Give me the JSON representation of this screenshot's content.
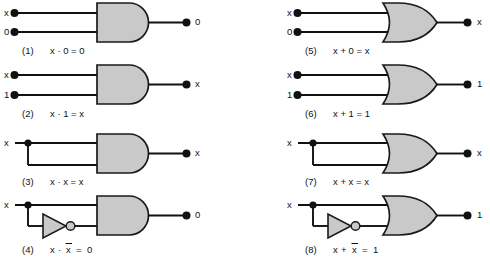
{
  "figure": {
    "background_color": "#ffffff",
    "gate_fill_color": "#c9c9c9",
    "line_color": "#111111"
  },
  "columns": [
    {
      "name": "and-column",
      "gate_type": "AND"
    },
    {
      "name": "or-column",
      "gate_type": "OR"
    }
  ],
  "circuits": [
    {
      "number": "(1)",
      "gate": "and-gate",
      "inputs": [
        "x",
        "0"
      ],
      "output": "0",
      "caption_expr": "x · 0 = 0",
      "expr_parts": [
        "x",
        "·",
        "0",
        "=",
        "0"
      ],
      "has_inverter": false,
      "has_junction": false,
      "column": "left"
    },
    {
      "number": "(2)",
      "gate": "and-gate",
      "inputs": [
        "x",
        "1"
      ],
      "output": "x",
      "caption_expr": "x · 1 = x",
      "expr_parts": [
        "x",
        "·",
        "1",
        "=",
        "x"
      ],
      "has_inverter": false,
      "has_junction": false,
      "column": "left"
    },
    {
      "number": "(3)",
      "gate": "and-gate",
      "inputs": [
        "x",
        ""
      ],
      "output": "x",
      "caption_expr": "x · x = x",
      "expr_parts": [
        "x",
        "·",
        "x",
        "=",
        "x"
      ],
      "has_inverter": false,
      "has_junction": true,
      "column": "left"
    },
    {
      "number": "(4)",
      "gate": "and-gate",
      "inputs": [
        "x",
        ""
      ],
      "output": "0",
      "caption_expr": "x · x̅ = 0",
      "expr_parts": [
        "x",
        "·",
        "x",
        "=",
        "0"
      ],
      "overbar_on": "second-operand",
      "has_inverter": true,
      "has_junction": true,
      "column": "left"
    },
    {
      "number": "(5)",
      "gate": "or-gate",
      "inputs": [
        "x",
        "0"
      ],
      "output": "x",
      "caption_expr": "x + 0 = x",
      "expr_parts": [
        "x",
        "+",
        "0",
        "=",
        "x"
      ],
      "has_inverter": false,
      "has_junction": false,
      "column": "right"
    },
    {
      "number": "(6)",
      "gate": "or-gate",
      "inputs": [
        "x",
        "1"
      ],
      "output": "1",
      "caption_expr": "x + 1 = 1",
      "expr_parts": [
        "x",
        "+",
        "1",
        "=",
        "1"
      ],
      "has_inverter": false,
      "has_junction": false,
      "column": "right"
    },
    {
      "number": "(7)",
      "gate": "or-gate",
      "inputs": [
        "x",
        ""
      ],
      "output": "x",
      "caption_expr": "x + x = x",
      "expr_parts": [
        "x",
        "+",
        "x",
        "=",
        "x"
      ],
      "has_inverter": false,
      "has_junction": true,
      "column": "right"
    },
    {
      "number": "(8)",
      "gate": "or-gate",
      "inputs": [
        "x",
        ""
      ],
      "output": "1",
      "caption_expr": "x + x̅ = 1",
      "expr_parts": [
        "x",
        "+",
        "x",
        "=",
        "1"
      ],
      "overbar_on": "second-operand",
      "has_inverter": true,
      "has_junction": true,
      "column": "right"
    }
  ]
}
